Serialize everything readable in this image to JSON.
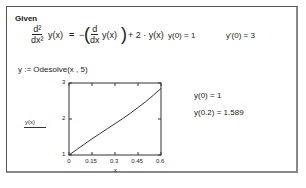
{
  "worksheet": {
    "given_label": "Given",
    "equation": {
      "lhs_num": "d²",
      "lhs_den": "dx²",
      "lhs_func": "y(x)",
      "equals": "=",
      "minus": "−",
      "rhs_num": "d",
      "rhs_den": "dx",
      "rhs_func": "y(x)",
      "plus_term": "+ 2 · y(x)"
    },
    "initial_condition_1": "y(0) = 1",
    "initial_condition_2": "y'(0) = 3",
    "solve_statement": "y := Odesolve(x , 5)",
    "results": [
      "y(0) = 1",
      "y(0.2) = 1.589"
    ]
  },
  "chart_data": {
    "type": "line",
    "title": "",
    "xlabel": "x",
    "ylabel": "y(x)",
    "xlim": [
      0,
      0.6
    ],
    "ylim": [
      1,
      3
    ],
    "x_ticks": [
      "0",
      "0.15",
      "0.3",
      "0.45",
      "0.6"
    ],
    "y_ticks": [
      "1",
      "2",
      "3"
    ],
    "grid": false,
    "series": [
      {
        "name": "y(x)",
        "x": [
          0,
          0.05,
          0.1,
          0.15,
          0.2,
          0.25,
          0.3,
          0.35,
          0.4,
          0.45,
          0.5,
          0.55,
          0.6
        ],
        "y": [
          1,
          1.15,
          1.3,
          1.45,
          1.589,
          1.73,
          1.87,
          2.01,
          2.16,
          2.32,
          2.48,
          2.66,
          2.85
        ]
      }
    ]
  }
}
